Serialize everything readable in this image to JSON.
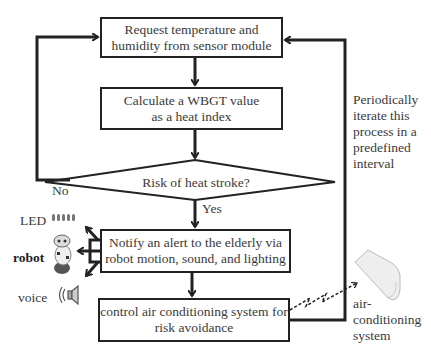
{
  "steps": {
    "request": {
      "line1": "Request temperature and",
      "line2": "humidity  from sensor module"
    },
    "calculate": {
      "line1": "Calculate a WBGT value",
      "line2": "as a heat index"
    },
    "decision": "Risk of heat stroke?",
    "notify": {
      "line1": "Notify an alert to the elderly via",
      "line2": "robot motion, sound, and lighting"
    },
    "control": {
      "line1": "control air conditioning  system for",
      "line2": "risk avoidance"
    }
  },
  "branches": {
    "no": "No",
    "yes": "Yes"
  },
  "loop_note": {
    "l1": "Periodically",
    "l2": "iterate this",
    "l3": "process in a",
    "l4": "predefined",
    "l5": "interval"
  },
  "outputs": {
    "led": "LED",
    "robot": "robot",
    "voice": "voice"
  },
  "device": {
    "l1": "air-",
    "l2": "conditioning",
    "l3": "system"
  }
}
